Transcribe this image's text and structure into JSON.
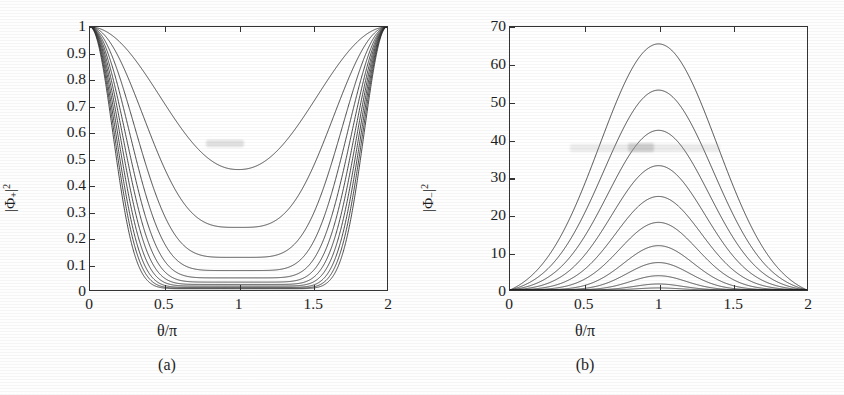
{
  "figure": {
    "title": "",
    "panels": [
      {
        "id": "a",
        "caption": "(a)",
        "xlabel": "θ/π",
        "ylabel_base": "|Φ",
        "ylabel_sub": "+",
        "ylabel_sup": "2",
        "xticks": [
          "0",
          "0.5",
          "1",
          "1.5",
          "2"
        ],
        "yticks": [
          "1",
          "0.9",
          "0.8",
          "0.7",
          "0.6",
          "0.5",
          "0.4",
          "0.3",
          "0.2",
          "0.1",
          "0"
        ]
      },
      {
        "id": "b",
        "caption": "(b)",
        "xlabel": "θ/π",
        "ylabel_base": "|Φ",
        "ylabel_sub": "−",
        "ylabel_sup": "2",
        "xticks": [
          "0",
          "0.5",
          "1",
          "1.5",
          "2"
        ],
        "yticks": [
          "70",
          "60",
          "50",
          "40",
          "30",
          "20",
          "10",
          "0"
        ]
      }
    ]
  },
  "chart_data": [
    {
      "type": "line",
      "panel": "a",
      "title": "",
      "xlabel": "θ/π",
      "ylabel": "|Φ₊|²",
      "xlim": [
        0,
        2
      ],
      "ylim": [
        0,
        1
      ],
      "xticks": [
        0,
        0.5,
        1,
        1.5,
        2
      ],
      "yticks": [
        0,
        0.1,
        0.2,
        0.3,
        0.4,
        0.5,
        0.6,
        0.7,
        0.8,
        0.9,
        1
      ],
      "grid": false,
      "legend": "none",
      "line_color": "#2b2b2b",
      "description": "Eleven U-shaped curves, each equal to 1 at θ/π = 0 and 2, dipping to a minimum at θ/π = 1. Minima decrease for successive curves.",
      "series": [
        {
          "name": "n=1",
          "minimum_at_pi": 0.458,
          "sharpness": 1.1
        },
        {
          "name": "n=2",
          "minimum_at_pi": 0.238,
          "sharpness": 1.75
        },
        {
          "name": "n=3",
          "minimum_at_pi": 0.124,
          "sharpness": 2.45
        },
        {
          "name": "n=4",
          "minimum_at_pi": 0.074,
          "sharpness": 3.15
        },
        {
          "name": "n=5",
          "minimum_at_pi": 0.046,
          "sharpness": 3.85
        },
        {
          "name": "n=6",
          "minimum_at_pi": 0.03,
          "sharpness": 4.55
        },
        {
          "name": "n=7",
          "minimum_at_pi": 0.021,
          "sharpness": 5.3
        },
        {
          "name": "n=8",
          "minimum_at_pi": 0.015,
          "sharpness": 6.1
        },
        {
          "name": "n=9",
          "minimum_at_pi": 0.01,
          "sharpness": 6.95
        },
        {
          "name": "n=10",
          "minimum_at_pi": 0.007,
          "sharpness": 7.85
        },
        {
          "name": "n=11",
          "minimum_at_pi": 0.005,
          "sharpness": 8.8
        }
      ],
      "x_samples": [
        0,
        0.1,
        0.2,
        0.3,
        0.4,
        0.5,
        0.6,
        0.7,
        0.8,
        0.9,
        1.0,
        1.1,
        1.2,
        1.3,
        1.4,
        1.5,
        1.6,
        1.7,
        1.8,
        1.9,
        2.0
      ]
    },
    {
      "type": "line",
      "panel": "b",
      "title": "",
      "xlabel": "θ/π",
      "ylabel": "|Φ₋|²",
      "xlim": [
        0,
        2
      ],
      "ylim": [
        0,
        70
      ],
      "xticks": [
        0,
        0.5,
        1,
        1.5,
        2
      ],
      "yticks": [
        0,
        10,
        20,
        30,
        40,
        50,
        60,
        70
      ],
      "grid": false,
      "legend": "none",
      "line_color": "#2b2b2b",
      "description": "Eleven bell-shaped curves, all zero at θ/π = 0 and 2, peaking at θ/π = 1. Peak heights decrease for successive curves.",
      "series": [
        {
          "name": "n=1",
          "peak_at_pi": 65.5,
          "width": 0.56
        },
        {
          "name": "n=2",
          "peak_at_pi": 53.2,
          "width": 0.52
        },
        {
          "name": "n=3",
          "peak_at_pi": 42.5,
          "width": 0.482
        },
        {
          "name": "n=4",
          "peak_at_pi": 33.1,
          "width": 0.444
        },
        {
          "name": "n=5",
          "peak_at_pi": 24.9,
          "width": 0.406
        },
        {
          "name": "n=6",
          "peak_at_pi": 18.0,
          "width": 0.368
        },
        {
          "name": "n=7",
          "peak_at_pi": 11.8,
          "width": 0.33
        },
        {
          "name": "n=8",
          "peak_at_pi": 7.3,
          "width": 0.296
        },
        {
          "name": "n=9",
          "peak_at_pi": 3.8,
          "width": 0.262
        },
        {
          "name": "n=10",
          "peak_at_pi": 1.6,
          "width": 0.23
        },
        {
          "name": "n=11",
          "peak_at_pi": 0.55,
          "width": 0.2
        }
      ],
      "x_samples": [
        0,
        0.1,
        0.2,
        0.3,
        0.4,
        0.5,
        0.6,
        0.7,
        0.8,
        0.9,
        1.0,
        1.1,
        1.2,
        1.3,
        1.4,
        1.5,
        1.6,
        1.7,
        1.8,
        1.9,
        2.0
      ]
    }
  ]
}
